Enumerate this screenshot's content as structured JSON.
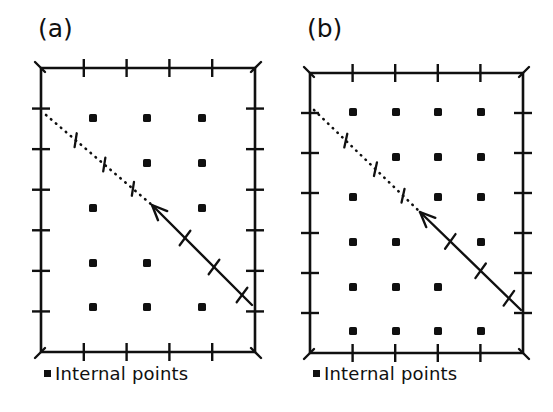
{
  "figure": {
    "title": "",
    "background": "#ffffff",
    "ink_color": "#101010",
    "panels": [
      {
        "id": "a",
        "label": "(a)",
        "label_pos": {
          "x": 38,
          "y": 18
        },
        "frame": {
          "x": 41,
          "y": 68,
          "width": 214,
          "height": 284
        },
        "ticks": {
          "top": 4,
          "bottom": 4,
          "left": 6,
          "right": 6
        },
        "grid": {
          "columns_x": [
            93,
            147,
            202
          ],
          "rows_y": [
            118,
            163,
            208,
            263,
            307
          ]
        },
        "internal_points": [
          {
            "x": 93,
            "y": 118
          },
          {
            "x": 147,
            "y": 118
          },
          {
            "x": 202,
            "y": 118
          },
          {
            "x": 147,
            "y": 163
          },
          {
            "x": 202,
            "y": 163
          },
          {
            "x": 93,
            "y": 208
          },
          {
            "x": 202,
            "y": 208
          },
          {
            "x": 93,
            "y": 263
          },
          {
            "x": 147,
            "y": 263
          },
          {
            "x": 93,
            "y": 307
          },
          {
            "x": 147,
            "y": 307
          },
          {
            "x": 202,
            "y": 307
          }
        ],
        "dotted_segment": {
          "x1": 46,
          "y1": 115,
          "x2": 152,
          "y2": 205
        },
        "solid_segment": {
          "x1": 152,
          "y1": 205,
          "x2": 252,
          "y2": 305
        },
        "arrow_at": {
          "x": 152,
          "y": 205
        },
        "dotted_hatches": [
          {
            "t": 0.28
          },
          {
            "t": 0.55
          },
          {
            "t": 0.82
          }
        ],
        "solid_hatches": [
          {
            "t": 0.33
          },
          {
            "t": 0.62
          },
          {
            "t": 0.9
          }
        ],
        "caption": "Internal points",
        "caption_marker": "filled-square",
        "caption_pos": {
          "x": 44,
          "y": 368
        }
      },
      {
        "id": "b",
        "label": "(b)",
        "label_pos": {
          "x": 307,
          "y": 18
        },
        "frame": {
          "x": 310,
          "y": 73,
          "width": 213,
          "height": 280
        },
        "ticks": {
          "top": 4,
          "bottom": 4,
          "left": 6,
          "right": 6
        },
        "grid": {
          "columns_x": [
            353,
            396,
            438,
            481
          ],
          "rows_y": [
            112,
            157,
            197,
            242,
            287,
            331
          ]
        },
        "internal_points": [
          {
            "x": 353,
            "y": 112
          },
          {
            "x": 396,
            "y": 112
          },
          {
            "x": 438,
            "y": 112
          },
          {
            "x": 481,
            "y": 112
          },
          {
            "x": 396,
            "y": 157
          },
          {
            "x": 438,
            "y": 157
          },
          {
            "x": 481,
            "y": 157
          },
          {
            "x": 353,
            "y": 197
          },
          {
            "x": 438,
            "y": 197
          },
          {
            "x": 481,
            "y": 197
          },
          {
            "x": 353,
            "y": 242
          },
          {
            "x": 396,
            "y": 242
          },
          {
            "x": 481,
            "y": 242
          },
          {
            "x": 353,
            "y": 287
          },
          {
            "x": 396,
            "y": 287
          },
          {
            "x": 438,
            "y": 287
          },
          {
            "x": 353,
            "y": 331
          },
          {
            "x": 396,
            "y": 331
          },
          {
            "x": 438,
            "y": 331
          },
          {
            "x": 481,
            "y": 331
          }
        ],
        "dotted_segment": {
          "x1": 314,
          "y1": 110,
          "x2": 420,
          "y2": 212
        },
        "solid_segment": {
          "x1": 420,
          "y1": 212,
          "x2": 521,
          "y2": 310
        },
        "arrow_at": {
          "x": 420,
          "y": 212
        },
        "dotted_hatches": [
          {
            "t": 0.3
          },
          {
            "t": 0.58
          },
          {
            "t": 0.84
          }
        ],
        "solid_hatches": [
          {
            "t": 0.3
          },
          {
            "t": 0.6
          },
          {
            "t": 0.88
          }
        ],
        "caption": "Internal points",
        "caption_marker": "filled-square",
        "caption_pos": {
          "x": 313,
          "y": 368
        }
      }
    ]
  },
  "chart_data": {
    "type": "scatter",
    "title": "",
    "xlabel": "",
    "ylabel": "",
    "grid": false,
    "legend": [
      "Internal points"
    ],
    "legend_position": "below-axes",
    "panels": [
      {
        "name": "(a)",
        "description": "Grid of internal points with a dotted/solid boundary line cutting the upper-left corner region; arrow marks the junction between dotted and solid portions.",
        "axis_ticks": {
          "x_interior": 4,
          "y_interior": 6
        },
        "grid_shape": {
          "columns": 3,
          "rows": 5
        },
        "points_unit": [
          [
            1,
            5
          ],
          [
            2,
            5
          ],
          [
            3,
            5
          ],
          [
            2,
            4
          ],
          [
            3,
            4
          ],
          [
            1,
            3
          ],
          [
            3,
            3
          ],
          [
            1,
            2
          ],
          [
            2,
            2
          ],
          [
            1,
            1
          ],
          [
            2,
            1
          ],
          [
            3,
            1
          ]
        ],
        "missing_points_unit": [
          [
            1,
            4
          ],
          [
            2,
            3
          ],
          [
            3,
            2
          ]
        ],
        "boundary_line": {
          "style_first_half": "dotted",
          "style_second_half": "solid",
          "hatch_marks_per_half": 3,
          "arrow_head": "at midpoint pointing up-left"
        }
      },
      {
        "name": "(b)",
        "description": "Denser grid of internal points with the same dotted/solid boundary line and arrow.",
        "axis_ticks": {
          "x_interior": 4,
          "y_interior": 6
        },
        "grid_shape": {
          "columns": 4,
          "rows": 6
        },
        "points_unit": [
          [
            1,
            6
          ],
          [
            2,
            6
          ],
          [
            3,
            6
          ],
          [
            4,
            6
          ],
          [
            2,
            5
          ],
          [
            3,
            5
          ],
          [
            4,
            5
          ],
          [
            1,
            4
          ],
          [
            3,
            4
          ],
          [
            4,
            4
          ],
          [
            1,
            3
          ],
          [
            2,
            3
          ],
          [
            4,
            3
          ],
          [
            1,
            2
          ],
          [
            2,
            2
          ],
          [
            3,
            2
          ],
          [
            1,
            1
          ],
          [
            2,
            1
          ],
          [
            3,
            1
          ],
          [
            4,
            1
          ]
        ],
        "missing_points_unit": [
          [
            1,
            5
          ],
          [
            2,
            4
          ],
          [
            3,
            3
          ],
          [
            4,
            2
          ]
        ],
        "boundary_line": {
          "style_first_half": "dotted",
          "style_second_half": "solid",
          "hatch_marks_per_half": 3,
          "arrow_head": "at midpoint pointing up-left"
        }
      }
    ]
  }
}
